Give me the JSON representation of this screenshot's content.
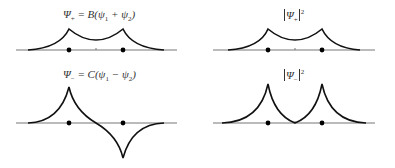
{
  "panels": [
    {
      "id": "psi-plus",
      "label_main": "Ψ",
      "label_sub": "+",
      "label_rest": " = B(ψ",
      "sub1": "1",
      "op": " + ψ",
      "sub2": "2",
      "close": ")"
    },
    {
      "id": "psi-plus-squared",
      "label_main": "Ψ",
      "label_sub": "+",
      "exp": "2"
    },
    {
      "id": "psi-minus",
      "label_main": "Ψ",
      "label_sub": "−",
      "label_rest": " = C(ψ",
      "sub1": "1",
      "op": " − ψ",
      "sub2": "2",
      "close": ")"
    },
    {
      "id": "psi-minus-squared",
      "label_main": "Ψ",
      "label_sub": "−",
      "exp": "2"
    }
  ],
  "colors": {
    "curve": "#111111",
    "axis": "#777777",
    "dot": "#000000",
    "text": "#333333"
  }
}
